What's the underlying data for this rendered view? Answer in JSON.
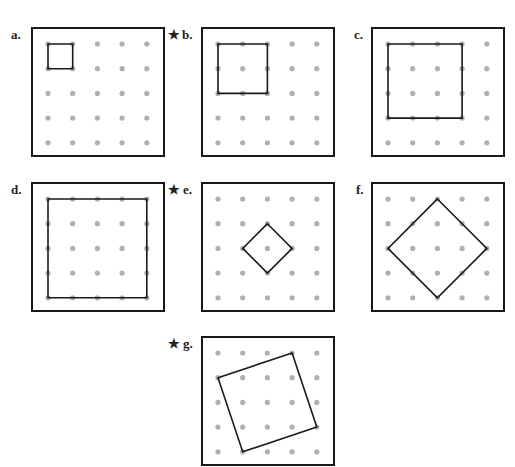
{
  "figure": {
    "grid": {
      "rows": 5,
      "cols": 5,
      "dot_color": "#b0b0b0",
      "line_color": "#1a1a1a"
    },
    "panels": [
      {
        "id": "a",
        "label": "a.",
        "starred": false,
        "shape": [
          [
            0,
            0
          ],
          [
            1,
            0
          ],
          [
            1,
            1
          ],
          [
            0,
            1
          ]
        ]
      },
      {
        "id": "b",
        "label": "b.",
        "starred": true,
        "shape": [
          [
            0,
            0
          ],
          [
            2,
            0
          ],
          [
            2,
            2
          ],
          [
            0,
            2
          ]
        ]
      },
      {
        "id": "c",
        "label": "c.",
        "starred": false,
        "shape": [
          [
            0,
            0
          ],
          [
            3,
            0
          ],
          [
            3,
            3
          ],
          [
            0,
            3
          ]
        ]
      },
      {
        "id": "d",
        "label": "d.",
        "starred": false,
        "shape": [
          [
            0,
            0
          ],
          [
            4,
            0
          ],
          [
            4,
            4
          ],
          [
            0,
            4
          ]
        ]
      },
      {
        "id": "e",
        "label": "e.",
        "starred": true,
        "shape": [
          [
            2,
            1
          ],
          [
            3,
            2
          ],
          [
            2,
            3
          ],
          [
            1,
            2
          ]
        ]
      },
      {
        "id": "f",
        "label": "f.",
        "starred": false,
        "shape": [
          [
            2,
            0
          ],
          [
            4,
            2
          ],
          [
            2,
            4
          ],
          [
            0,
            2
          ]
        ]
      },
      {
        "id": "g",
        "label": "g.",
        "starred": true,
        "shape": [
          [
            0,
            1
          ],
          [
            3,
            0
          ],
          [
            4,
            3
          ],
          [
            1,
            4
          ]
        ]
      }
    ],
    "star_glyph": "★"
  }
}
